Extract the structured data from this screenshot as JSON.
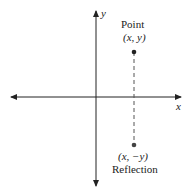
{
  "diagram": {
    "axes": {
      "x_label": "x",
      "y_label": "y"
    },
    "point": {
      "title": "Point",
      "coords": "(x, y)"
    },
    "reflection": {
      "title": "Reflection",
      "coords": "(x, −y)"
    },
    "colors": {
      "ink": "#222222",
      "dashed": "#555555"
    }
  }
}
